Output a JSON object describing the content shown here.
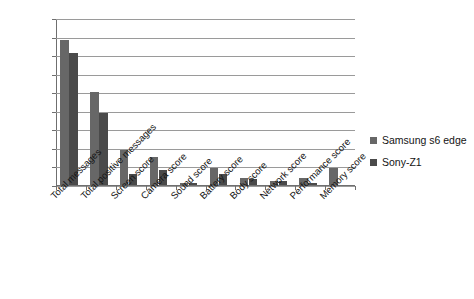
{
  "chart_data": {
    "type": "bar",
    "title": "",
    "subtitle": "",
    "xlabel": "",
    "ylabel": "",
    "ylim": [
      0,
      90
    ],
    "ytick_step": 10,
    "yticks": [
      90,
      80,
      70,
      60,
      50,
      40,
      30,
      20,
      10,
      0
    ],
    "grid": "horizontal",
    "legend_position": "right",
    "orientation": "vertical",
    "grouping": "grouped",
    "categories": [
      "Total messages",
      "Total positive messages",
      "Screen score",
      "Camera score",
      "Sound score",
      "Battery score",
      "Body score",
      "Network score",
      "Performance score",
      "Memory score"
    ],
    "series": [
      {
        "name": "Samsung s6 edge",
        "color": "#676767",
        "values": [
          78,
          50,
          19,
          15,
          1,
          9,
          4,
          2,
          4,
          9
        ]
      },
      {
        "name": "Sony-Z1",
        "color": "#4a4a4a",
        "values": [
          71,
          39,
          6,
          8,
          1,
          6,
          3,
          2,
          1,
          0
        ]
      }
    ]
  },
  "legend": {
    "entries": [
      {
        "label": "Samsung s6 edge",
        "swatch": "#676767"
      },
      {
        "label": "Sony-Z1",
        "swatch": "#4a4a4a"
      }
    ]
  },
  "colors": {
    "background": "#ffffff",
    "grid": "#9a9a9a",
    "axis": "#6f6f6f",
    "text": "#141414",
    "series_samsung": "#676767",
    "series_sony": "#4a4a4a"
  }
}
